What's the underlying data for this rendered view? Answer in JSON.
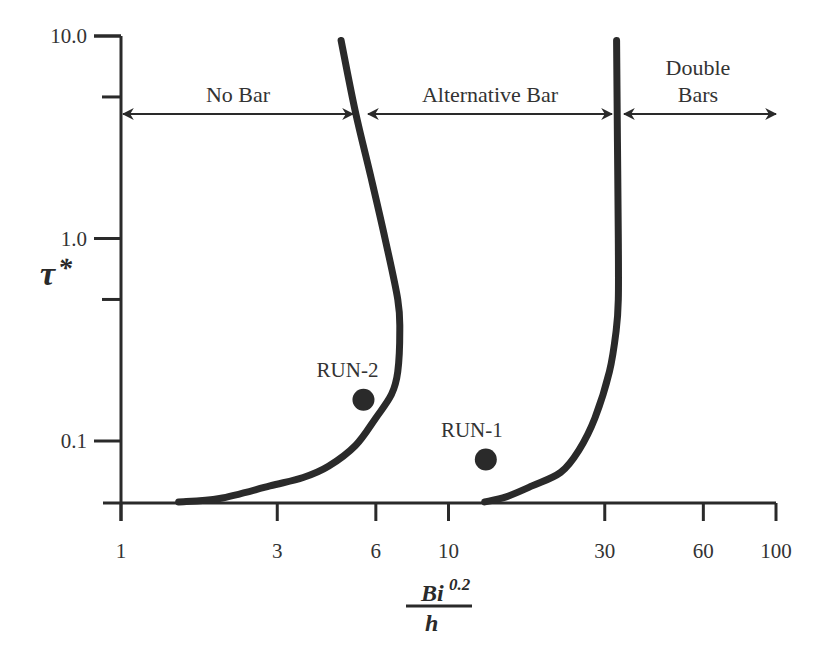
{
  "chart_data": {
    "type": "line",
    "title": "",
    "xlabel": "Bi^0.2 / h",
    "xlabel_parts": {
      "numerator": "Bi",
      "exponent": "0.2",
      "denominator": "h"
    },
    "ylabel": "τ*",
    "ylabel_parts": {
      "symbol": "τ",
      "subscript": "*"
    },
    "x_scale": "log",
    "y_scale": "log",
    "xlim": [
      1,
      100
    ],
    "ylim": [
      0.05,
      10
    ],
    "grid": false,
    "x_ticks": [
      {
        "value": 1,
        "label": "1"
      },
      {
        "value": 3,
        "label": "3"
      },
      {
        "value": 6,
        "label": "6"
      },
      {
        "value": 10,
        "label": "10"
      },
      {
        "value": 30,
        "label": "30"
      },
      {
        "value": 60,
        "label": "60"
      },
      {
        "value": 100,
        "label": "100"
      }
    ],
    "y_ticks": [
      {
        "value": 10,
        "label": "10.0"
      },
      {
        "value": 5,
        "label": ""
      },
      {
        "value": 1,
        "label": "1.0"
      },
      {
        "value": 0.5,
        "label": ""
      },
      {
        "value": 0.1,
        "label": "0.1"
      }
    ],
    "regions": [
      {
        "name": "No Bar",
        "label_lines": [
          "No Bar"
        ],
        "x_from": 1,
        "x_to": 5.2
      },
      {
        "name": "Alternative Bar",
        "label_lines": [
          "Alternative Bar"
        ],
        "x_from": 5.2,
        "x_to": 33
      },
      {
        "name": "Double Bars",
        "label_lines": [
          "Double",
          "Bars"
        ],
        "x_from": 33,
        "x_to": 100
      }
    ],
    "series": [
      {
        "name": "No Bar / Alternative Bar boundary",
        "x": [
          1.5,
          2.0,
          2.85,
          3.6,
          4.3,
          5.2,
          6.0,
          6.7,
          7.0,
          7.1,
          7.0,
          6.4,
          5.8,
          5.2,
          4.7
        ],
        "y": [
          0.05,
          0.052,
          0.06,
          0.066,
          0.075,
          0.095,
          0.13,
          0.17,
          0.22,
          0.35,
          0.5,
          1.0,
          2.0,
          4.2,
          9.5
        ]
      },
      {
        "name": "Alternative Bar / Double Bars boundary",
        "x": [
          12.9,
          15,
          18,
          22,
          25,
          28,
          31,
          32.5,
          33,
          33,
          32.8,
          32.6
        ],
        "y": [
          0.05,
          0.053,
          0.06,
          0.07,
          0.09,
          0.13,
          0.22,
          0.35,
          0.5,
          1.0,
          3.0,
          9.5
        ]
      }
    ],
    "points": [
      {
        "name": "RUN-2",
        "x": 5.5,
        "y": 0.16
      },
      {
        "name": "RUN-1",
        "x": 13,
        "y": 0.081
      }
    ]
  }
}
